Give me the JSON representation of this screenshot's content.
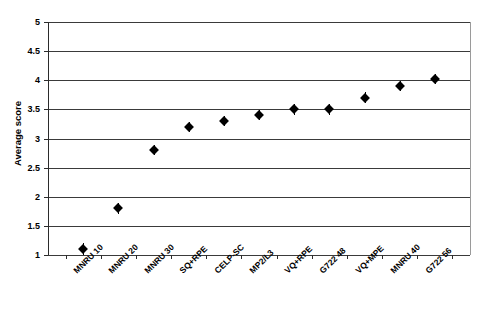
{
  "chart_data": {
    "type": "scatter",
    "title": "",
    "xlabel": "",
    "ylabel": "Average score",
    "ylim": [
      1,
      5
    ],
    "ytick_step": 0.5,
    "yticks": [
      "5",
      "4.5",
      "4",
      "3.5",
      "3",
      "2.5",
      "2",
      "1.5",
      "1"
    ],
    "grid": true,
    "legend": "none",
    "marker": "diamond",
    "error_bars": "symmetric",
    "categories": [
      "MNRU 10",
      "MNRU 20",
      "MNRU 30",
      "SQ+RPE",
      "CELP-SC",
      "MP2/L3",
      "VQ+RPE",
      "G722 48",
      "VQ+MPE",
      "MNRU 40",
      "G722 56"
    ],
    "values": [
      1.1,
      1.8,
      2.8,
      3.2,
      3.3,
      3.4,
      3.5,
      3.5,
      3.7,
      3.9,
      4.02
    ],
    "errors": [
      0.1,
      0.1,
      0.09,
      0.09,
      0.09,
      0.09,
      0.09,
      0.09,
      0.09,
      0.09,
      0.09
    ]
  }
}
